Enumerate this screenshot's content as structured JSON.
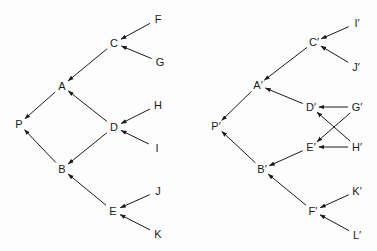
{
  "diagrams": [
    {
      "name": "left-tree",
      "nodes": [
        {
          "id": "P",
          "label": "P",
          "x": 19,
          "y": 124
        },
        {
          "id": "A",
          "label": "A",
          "x": 62,
          "y": 86
        },
        {
          "id": "B",
          "label": "B",
          "x": 62,
          "y": 169
        },
        {
          "id": "C",
          "label": "C",
          "x": 114,
          "y": 43
        },
        {
          "id": "D",
          "label": "D",
          "x": 114,
          "y": 127
        },
        {
          "id": "E",
          "label": "E",
          "x": 113,
          "y": 211
        },
        {
          "id": "F",
          "label": "F",
          "x": 158,
          "y": 19
        },
        {
          "id": "G",
          "label": "G",
          "x": 160,
          "y": 62
        },
        {
          "id": "H",
          "label": "H",
          "x": 158,
          "y": 105
        },
        {
          "id": "I",
          "label": "I",
          "x": 157,
          "y": 148
        },
        {
          "id": "J",
          "label": "J",
          "x": 158,
          "y": 191
        },
        {
          "id": "K",
          "label": "K",
          "x": 158,
          "y": 234
        }
      ],
      "edges": [
        {
          "from": "F",
          "to": "C"
        },
        {
          "from": "G",
          "to": "C"
        },
        {
          "from": "H",
          "to": "D"
        },
        {
          "from": "I",
          "to": "D"
        },
        {
          "from": "J",
          "to": "E"
        },
        {
          "from": "K",
          "to": "E"
        },
        {
          "from": "C",
          "to": "A"
        },
        {
          "from": "D",
          "to": "A"
        },
        {
          "from": "D",
          "to": "B"
        },
        {
          "from": "E",
          "to": "B"
        },
        {
          "from": "A",
          "to": "P"
        },
        {
          "from": "B",
          "to": "P"
        }
      ]
    },
    {
      "name": "right-tree",
      "nodes": [
        {
          "id": "P'",
          "label": "P′",
          "x": 216,
          "y": 126
        },
        {
          "id": "A'",
          "label": "A′",
          "x": 258,
          "y": 85
        },
        {
          "id": "B'",
          "label": "B′",
          "x": 262,
          "y": 169
        },
        {
          "id": "C'",
          "label": "C′",
          "x": 314,
          "y": 42
        },
        {
          "id": "D'",
          "label": "D′",
          "x": 311,
          "y": 107
        },
        {
          "id": "E'",
          "label": "E′",
          "x": 311,
          "y": 147
        },
        {
          "id": "F'",
          "label": "F′",
          "x": 313,
          "y": 211
        },
        {
          "id": "I'",
          "label": "I′",
          "x": 357,
          "y": 23
        },
        {
          "id": "J'",
          "label": "J′",
          "x": 356,
          "y": 67
        },
        {
          "id": "G'",
          "label": "G′",
          "x": 357,
          "y": 107
        },
        {
          "id": "H'",
          "label": "H′",
          "x": 357,
          "y": 147
        },
        {
          "id": "K'",
          "label": "K′",
          "x": 357,
          "y": 191
        },
        {
          "id": "L'",
          "label": "L′",
          "x": 357,
          "y": 235
        }
      ],
      "edges": [
        {
          "from": "I'",
          "to": "C'"
        },
        {
          "from": "J'",
          "to": "C'"
        },
        {
          "from": "G'",
          "to": "D'"
        },
        {
          "from": "H'",
          "to": "D'"
        },
        {
          "from": "G'",
          "to": "E'"
        },
        {
          "from": "H'",
          "to": "E'"
        },
        {
          "from": "K'",
          "to": "F'"
        },
        {
          "from": "L'",
          "to": "F'"
        },
        {
          "from": "C'",
          "to": "A'"
        },
        {
          "from": "D'",
          "to": "A'"
        },
        {
          "from": "E'",
          "to": "B'"
        },
        {
          "from": "F'",
          "to": "B'"
        },
        {
          "from": "A'",
          "to": "P'"
        },
        {
          "from": "B'",
          "to": "P'"
        }
      ]
    }
  ],
  "colors": {
    "ink": "#1a1a1a",
    "background": "#fdfdfd"
  }
}
